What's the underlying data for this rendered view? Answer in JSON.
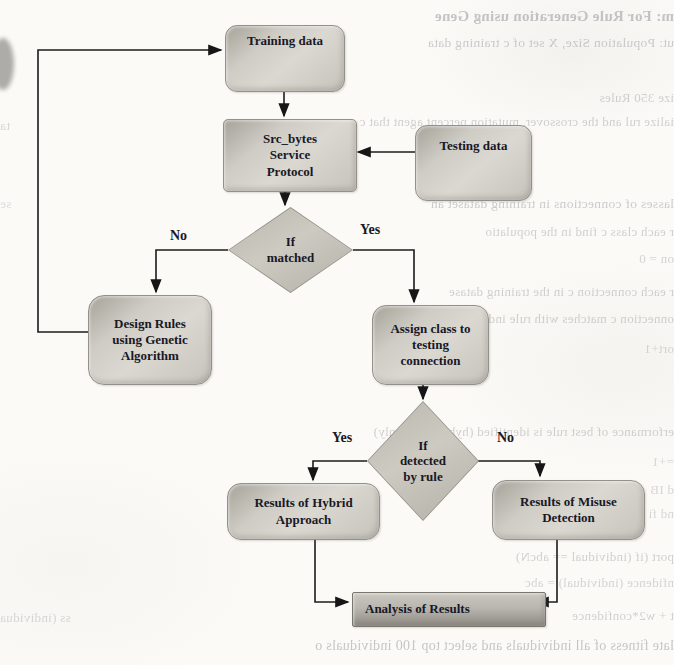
{
  "figure": {
    "nodes": {
      "training": {
        "label": "Training data"
      },
      "src_bytes": {
        "lines": [
          "Src_bytes",
          "Service",
          "Protocol"
        ]
      },
      "testing": {
        "label": "Testing data"
      },
      "decision_matched": {
        "lines": [
          "If",
          "matched"
        ]
      },
      "design_rules": {
        "lines": [
          "Design Rules",
          "using Genetic",
          "Algorithm"
        ]
      },
      "assign_class": {
        "lines": [
          "Assign class to",
          "testing",
          "connection"
        ]
      },
      "decision_detected": {
        "lines": [
          "If",
          "detected",
          "by rule"
        ]
      },
      "hybrid": {
        "lines": [
          "Results of Hybrid",
          "Approach"
        ]
      },
      "misuse": {
        "lines": [
          "Results of Misuse",
          "Detection"
        ]
      },
      "analysis": {
        "label": "Analysis of Results"
      }
    },
    "branch_labels": {
      "matched_no": "No",
      "matched_yes": "Yes",
      "detected_yes": "Yes",
      "detected_no": "No"
    },
    "colors": {
      "node_fill": "#d3d0c9",
      "node_edge": "#94918a",
      "ink": "#1c1c1c",
      "bleed_text": "#6e6e78",
      "page": "#fbfaf7"
    }
  },
  "bleed_lines": [
    {
      "text": "m: For Rule Generation using Gene",
      "x": 345,
      "y": 8,
      "w": 329,
      "size": 15,
      "weight": 700,
      "anchor": "start",
      "op": 0.38
    },
    {
      "text": "ut: Population Size, X set of c training data",
      "x": 358,
      "y": 35,
      "w": 316,
      "size": 13.5,
      "weight": 400,
      "anchor": "start",
      "op": 0.33
    },
    {
      "text": "ize 350 Rules",
      "x": 520,
      "y": 90,
      "w": 154,
      "size": 13,
      "weight": 400,
      "anchor": "start",
      "op": 0.3
    },
    {
      "text": "ialize rul and the crossover, mutation percent agent that c",
      "x": 300,
      "y": 114,
      "w": 374,
      "size": 13,
      "weight": 400,
      "anchor": "start",
      "op": 0.3
    },
    {
      "text": "ta",
      "x": 0,
      "y": 118,
      "w": 46,
      "size": 13,
      "weight": 400,
      "anchor": "end",
      "op": 0.25
    },
    {
      "text": "lasses of connections in training dataset an",
      "x": 305,
      "y": 196,
      "w": 369,
      "size": 13.5,
      "weight": 400,
      "anchor": "start",
      "op": 0.33
    },
    {
      "text": "se",
      "x": 0,
      "y": 196,
      "w": 40,
      "size": 13,
      "weight": 400,
      "anchor": "end",
      "op": 0.22
    },
    {
      "text": "r each class c find in the populatio",
      "x": 330,
      "y": 224,
      "w": 344,
      "size": 13,
      "weight": 400,
      "anchor": "start",
      "op": 0.3
    },
    {
      "text": "on = 0",
      "x": 585,
      "y": 251,
      "w": 89,
      "size": 13,
      "weight": 400,
      "anchor": "start",
      "op": 0.28
    },
    {
      "text": "r each connection c in the training datase",
      "x": 335,
      "y": 284,
      "w": 339,
      "size": 13,
      "weight": 400,
      "anchor": "start",
      "op": 0.3
    },
    {
      "text": "onnection c matches with rule individual-I then c",
      "x": 330,
      "y": 311,
      "w": 344,
      "size": 13,
      "weight": 400,
      "anchor": "start",
      "op": 0.3
    },
    {
      "text": "ort+1",
      "x": 600,
      "y": 341,
      "w": 74,
      "size": 13,
      "weight": 400,
      "anchor": "start",
      "op": 0.26
    },
    {
      "text": "erformance of best rule is identified (hybrid pos- only)",
      "x": 190,
      "y": 424,
      "w": 484,
      "size": 13,
      "weight": 400,
      "anchor": "start",
      "op": 0.3
    },
    {
      "text": "=+1",
      "x": 598,
      "y": 454,
      "w": 76,
      "size": 13,
      "weight": 400,
      "anchor": "start",
      "op": 0.26
    },
    {
      "text": "d IB",
      "x": 614,
      "y": 482,
      "w": 60,
      "size": 13,
      "weight": 400,
      "anchor": "start",
      "op": 0.25
    },
    {
      "text": "nd fi",
      "x": 610,
      "y": 506,
      "w": 64,
      "size": 13,
      "weight": 400,
      "anchor": "start",
      "op": 0.25
    },
    {
      "text": "port (if (individual == abcN)",
      "x": 430,
      "y": 549,
      "w": 244,
      "size": 13,
      "weight": 400,
      "anchor": "start",
      "op": 0.3
    },
    {
      "text": "nfidence (individual) = abc",
      "x": 435,
      "y": 575,
      "w": 239,
      "size": 13,
      "weight": 400,
      "anchor": "start",
      "op": 0.28
    },
    {
      "text": "t + w2*confidence",
      "x": 520,
      "y": 608,
      "w": 154,
      "size": 13,
      "weight": 400,
      "anchor": "start",
      "op": 0.3
    },
    {
      "text": "ss (individua",
      "x": 0,
      "y": 610,
      "w": 80,
      "size": 13,
      "weight": 400,
      "anchor": "end",
      "op": 0.25
    },
    {
      "text": "late fitness of all individuals and select top 100 individuals o",
      "x": 0,
      "y": 638,
      "w": 674,
      "size": 14,
      "weight": 400,
      "anchor": "start",
      "op": 0.38
    }
  ]
}
